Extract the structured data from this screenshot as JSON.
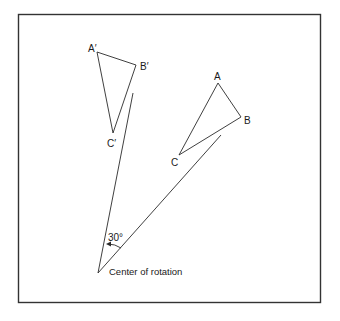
{
  "diagram": {
    "type": "rotation",
    "angle_label": "30°",
    "center_label": "Center of rotation",
    "colors": {
      "stroke": "#2a2a2a",
      "frame": "#333333",
      "background": "#ffffff"
    },
    "original_triangle": {
      "labels": {
        "A": "A",
        "B": "B",
        "C": "C"
      },
      "vertices": {
        "A": [
          218,
          83
        ],
        "B": [
          241,
          117
        ],
        "C": [
          179,
          155
        ]
      }
    },
    "image_triangle": {
      "labels": {
        "A": "A′",
        "B": "B′",
        "C": "C′"
      },
      "vertices": {
        "A": [
          97,
          52
        ],
        "B": [
          136,
          65
        ],
        "C": [
          113,
          133
        ]
      }
    },
    "center": [
      98,
      273
    ],
    "ray_to_image_end": [
      133,
      93
    ],
    "ray_to_original_end": [
      221,
      135
    ]
  }
}
